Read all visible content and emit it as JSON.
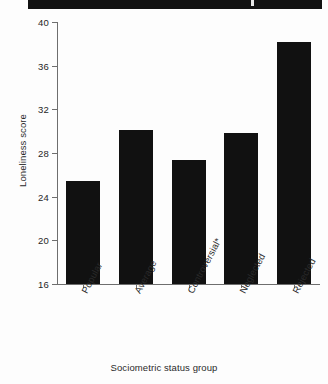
{
  "chart_data": {
    "type": "bar",
    "title": "",
    "subtitle": "",
    "xlabel": "Sociometric status group",
    "ylabel": "Loneliness score",
    "categories": [
      "Popular",
      "Average",
      "Controversial*",
      "Neglected",
      "Rejected"
    ],
    "values": [
      25.4,
      30.1,
      27.4,
      29.8,
      38.2
    ],
    "ylim": [
      16,
      40
    ],
    "yticks": [
      16,
      20,
      24,
      28,
      32,
      36,
      40
    ],
    "ytick_labels": [
      "16",
      "20",
      "24",
      "28",
      "32",
      "36",
      "40"
    ],
    "grid": false,
    "legend": false,
    "legend_position": "none",
    "bar_color": "#111111",
    "axis_color": "#6e6e6e",
    "annotations": [
      "* asterisk on 'Controversial' category label"
    ]
  },
  "figure": {
    "background": "#ffffff",
    "scan_band_color": "#121212"
  }
}
